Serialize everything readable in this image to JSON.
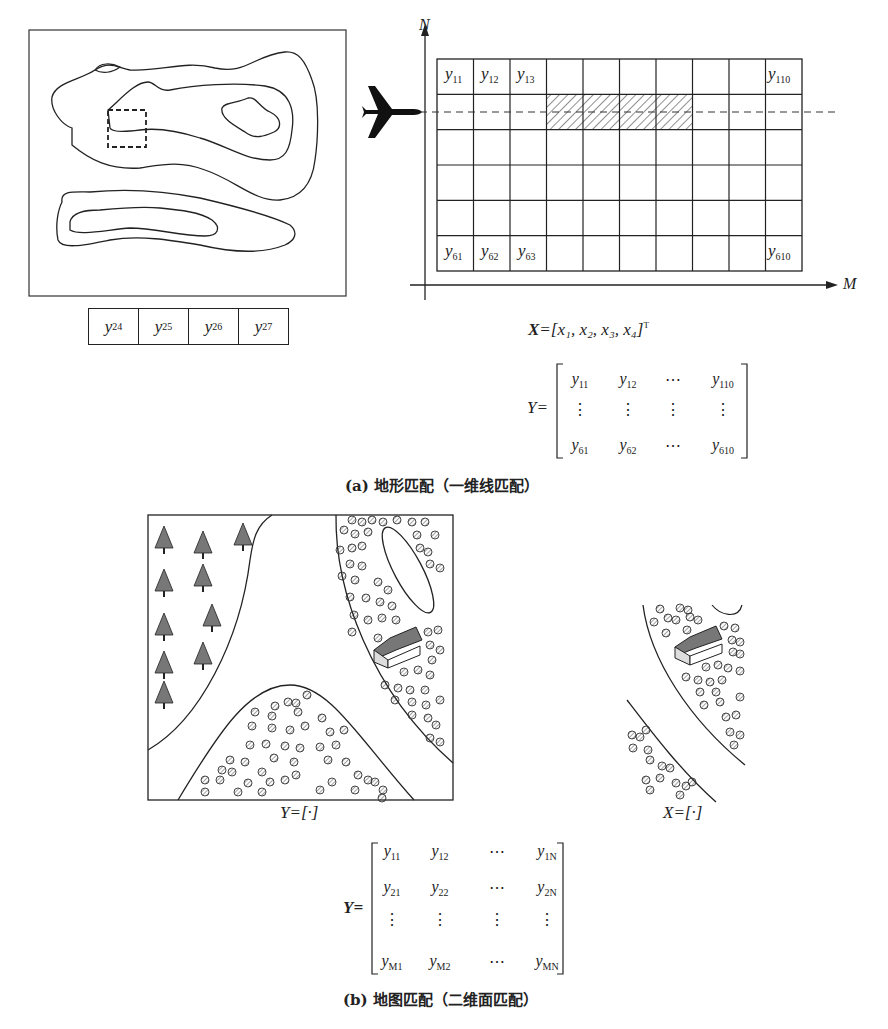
{
  "figure_a": {
    "caption": "(a) 地形匹配（一维线匹配）",
    "strip_cells": [
      {
        "base": "y",
        "sub": "24"
      },
      {
        "base": "y",
        "sub": "25"
      },
      {
        "base": "y",
        "sub": "26"
      },
      {
        "base": "y",
        "sub": "27"
      }
    ],
    "grid": {
      "rows": 6,
      "cols": 10,
      "axis_n_label": "N",
      "axis_m_label": "M",
      "hatched_row": 2,
      "hatched_cols": [
        4,
        5,
        6,
        7
      ],
      "labels": [
        {
          "base": "y",
          "sub": "11",
          "row": 1,
          "col": 1
        },
        {
          "base": "y",
          "sub": "12",
          "row": 1,
          "col": 2
        },
        {
          "base": "y",
          "sub": "13",
          "row": 1,
          "col": 3
        },
        {
          "base": "y",
          "sub": "110",
          "row": 1,
          "col": 10
        },
        {
          "base": "y",
          "sub": "61",
          "row": 6,
          "col": 1
        },
        {
          "base": "y",
          "sub": "62",
          "row": 6,
          "col": 2
        },
        {
          "base": "y",
          "sub": "63",
          "row": 6,
          "col": 3
        },
        {
          "base": "y",
          "sub": "610",
          "row": 6,
          "col": 10
        }
      ]
    },
    "icon": "airplane-icon",
    "x_equation": {
      "lhs": "X",
      "rhs": "=[x₁, x₂, x₃, x₄]",
      "sup": "T"
    },
    "y_matrix": {
      "lhs": "Y=",
      "rows": [
        [
          {
            "b": "y",
            "s": "11"
          },
          {
            "b": "y",
            "s": "12"
          },
          {
            "b": "⋯",
            "s": ""
          },
          {
            "b": "y",
            "s": "110"
          }
        ],
        [
          {
            "b": "⋮",
            "s": ""
          },
          {
            "b": "⋮",
            "s": ""
          },
          {
            "b": "⋮",
            "s": ""
          },
          {
            "b": "⋮",
            "s": ""
          }
        ],
        [
          {
            "b": "y",
            "s": "61"
          },
          {
            "b": "y",
            "s": "62"
          },
          {
            "b": "⋯",
            "s": ""
          },
          {
            "b": "y",
            "s": "610"
          }
        ]
      ]
    }
  },
  "figure_b": {
    "caption": "(b) 地图匹配（二维面匹配）",
    "map_label": "Y=[·]",
    "patch_label": "X=[·]",
    "icons": [
      "tree-icon",
      "house-icon",
      "shrub-icon"
    ],
    "y_matrix": {
      "lhs": "Y=",
      "rows": [
        [
          {
            "b": "y",
            "s": "11"
          },
          {
            "b": "y",
            "s": "12"
          },
          {
            "b": "⋯",
            "s": ""
          },
          {
            "b": "y",
            "s": "1N"
          }
        ],
        [
          {
            "b": "y",
            "s": "21"
          },
          {
            "b": "y",
            "s": "22"
          },
          {
            "b": "⋯",
            "s": ""
          },
          {
            "b": "y",
            "s": "2N"
          }
        ],
        [
          {
            "b": "⋮",
            "s": ""
          },
          {
            "b": "⋮",
            "s": ""
          },
          {
            "b": "⋮",
            "s": ""
          },
          {
            "b": "⋮",
            "s": ""
          }
        ],
        [
          {
            "b": "y",
            "s": "M1"
          },
          {
            "b": "y",
            "s": "M2"
          },
          {
            "b": "⋯",
            "s": ""
          },
          {
            "b": "y",
            "s": "MN"
          }
        ]
      ]
    }
  }
}
